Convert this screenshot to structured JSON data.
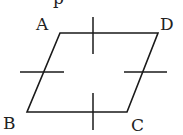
{
  "figure": {
    "type": "parallelogram",
    "stroke_color": "#1a1a1a",
    "background": "#ffffff",
    "vertices": {
      "A": {
        "label": "A",
        "x": 60,
        "y": 33
      },
      "B": {
        "label": "B",
        "x": 27,
        "y": 112
      },
      "C": {
        "label": "C",
        "x": 127,
        "y": 112
      },
      "D": {
        "label": "D",
        "x": 158,
        "y": 33
      }
    },
    "labels": {
      "A": "A",
      "B": "B",
      "C": "C",
      "D": "D"
    },
    "tick_marks": [
      {
        "side": "AD",
        "orientation": "vertical",
        "x": 93,
        "y1": 17,
        "y2": 54
      },
      {
        "side": "BC",
        "orientation": "vertical",
        "x": 93,
        "y1": 93,
        "y2": 130
      },
      {
        "side": "AB",
        "orientation": "horizontal",
        "y": 72,
        "x1": 20,
        "x2": 64
      },
      {
        "side": "DC",
        "orientation": "horizontal",
        "y": 72,
        "x1": 124,
        "x2": 167
      }
    ],
    "top_partial_text": "p"
  }
}
